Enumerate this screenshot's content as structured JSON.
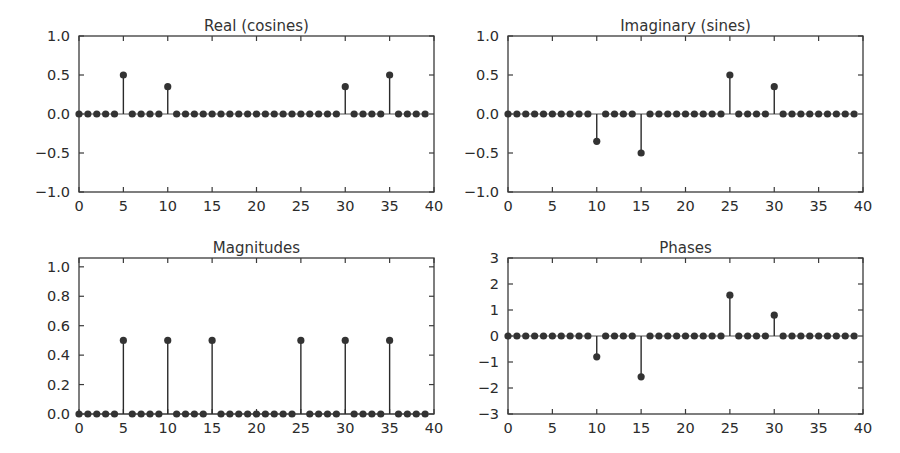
{
  "figure": {
    "background_color": "#ffffff",
    "marker_color": "#333333",
    "axis_color": "#3a3a3a",
    "width": 900,
    "height": 453
  },
  "chart_data": [
    {
      "type": "line",
      "plot_style": "stem",
      "title": "Real (cosines)",
      "xlabel": "",
      "ylabel": "",
      "xlim": [
        0,
        40
      ],
      "ylim": [
        -1.0,
        1.0
      ],
      "xticks": [
        0,
        5,
        10,
        15,
        20,
        25,
        30,
        35,
        40
      ],
      "xticklabels": [
        "0",
        "5",
        "10",
        "15",
        "20",
        "25",
        "30",
        "35",
        "40"
      ],
      "yticks": [
        -1.0,
        -0.5,
        0.0,
        0.5,
        1.0
      ],
      "yticklabels": [
        "-1.0",
        "-0.5",
        "0.0",
        "0.5",
        "1.0"
      ],
      "grid": false,
      "legend": null,
      "x": [
        0,
        1,
        2,
        3,
        4,
        5,
        6,
        7,
        8,
        9,
        10,
        11,
        12,
        13,
        14,
        15,
        16,
        17,
        18,
        19,
        20,
        21,
        22,
        23,
        24,
        25,
        26,
        27,
        28,
        29,
        30,
        31,
        32,
        33,
        34,
        35,
        36,
        37,
        38,
        39
      ],
      "values": [
        0,
        0,
        0,
        0,
        0,
        0.5,
        0,
        0,
        0,
        0,
        0.35,
        0,
        0,
        0,
        0,
        0,
        0,
        0,
        0,
        0,
        0,
        0,
        0,
        0,
        0,
        0,
        0,
        0,
        0,
        0,
        0.35,
        0,
        0,
        0,
        0,
        0.5,
        0,
        0,
        0,
        0
      ]
    },
    {
      "type": "line",
      "plot_style": "stem",
      "title": "Imaginary (sines)",
      "xlabel": "",
      "ylabel": "",
      "xlim": [
        0,
        40
      ],
      "ylim": [
        -1.0,
        1.0
      ],
      "xticks": [
        0,
        5,
        10,
        15,
        20,
        25,
        30,
        35,
        40
      ],
      "xticklabels": [
        "0",
        "5",
        "10",
        "15",
        "20",
        "25",
        "30",
        "35",
        "40"
      ],
      "yticks": [
        -1.0,
        -0.5,
        0.0,
        0.5,
        1.0
      ],
      "yticklabels": [
        "-1.0",
        "-0.5",
        "0.0",
        "0.5",
        "1.0"
      ],
      "grid": false,
      "legend": null,
      "x": [
        0,
        1,
        2,
        3,
        4,
        5,
        6,
        7,
        8,
        9,
        10,
        11,
        12,
        13,
        14,
        15,
        16,
        17,
        18,
        19,
        20,
        21,
        22,
        23,
        24,
        25,
        26,
        27,
        28,
        29,
        30,
        31,
        32,
        33,
        34,
        35,
        36,
        37,
        38,
        39
      ],
      "values": [
        0,
        0,
        0,
        0,
        0,
        0,
        0,
        0,
        0,
        0,
        -0.35,
        0,
        0,
        0,
        0,
        -0.5,
        0,
        0,
        0,
        0,
        0,
        0,
        0,
        0,
        0,
        0.5,
        0,
        0,
        0,
        0,
        0.35,
        0,
        0,
        0,
        0,
        0,
        0,
        0,
        0,
        0
      ]
    },
    {
      "type": "line",
      "plot_style": "stem",
      "title": "Magnitudes",
      "xlabel": "",
      "ylabel": "",
      "xlim": [
        0,
        40
      ],
      "ylim": [
        0.0,
        1.06
      ],
      "xticks": [
        0,
        5,
        10,
        15,
        20,
        25,
        30,
        35,
        40
      ],
      "xticklabels": [
        "0",
        "5",
        "10",
        "15",
        "20",
        "25",
        "30",
        "35",
        "40"
      ],
      "yticks": [
        0.0,
        0.2,
        0.4,
        0.6,
        0.8,
        1.0
      ],
      "yticklabels": [
        "0.0",
        "0.2",
        "0.4",
        "0.6",
        "0.8",
        "1.0"
      ],
      "grid": false,
      "legend": null,
      "x": [
        0,
        1,
        2,
        3,
        4,
        5,
        6,
        7,
        8,
        9,
        10,
        11,
        12,
        13,
        14,
        15,
        16,
        17,
        18,
        19,
        20,
        21,
        22,
        23,
        24,
        25,
        26,
        27,
        28,
        29,
        30,
        31,
        32,
        33,
        34,
        35,
        36,
        37,
        38,
        39
      ],
      "values": [
        0,
        0,
        0,
        0,
        0,
        0.5,
        0,
        0,
        0,
        0,
        0.5,
        0,
        0,
        0,
        0,
        0.5,
        0,
        0,
        0,
        0,
        0,
        0,
        0,
        0,
        0,
        0.5,
        0,
        0,
        0,
        0,
        0.5,
        0,
        0,
        0,
        0,
        0.5,
        0,
        0,
        0,
        0
      ]
    },
    {
      "type": "line",
      "plot_style": "stem",
      "title": "Phases",
      "xlabel": "",
      "ylabel": "",
      "xlim": [
        0,
        40
      ],
      "ylim": [
        -3,
        3
      ],
      "xticks": [
        0,
        5,
        10,
        15,
        20,
        25,
        30,
        35,
        40
      ],
      "xticklabels": [
        "0",
        "5",
        "10",
        "15",
        "20",
        "25",
        "30",
        "35",
        "40"
      ],
      "yticks": [
        -3,
        -2,
        -1,
        0,
        1,
        2,
        3
      ],
      "yticklabels": [
        "-3",
        "-2",
        "-1",
        "0",
        "1",
        "2",
        "3"
      ],
      "grid": false,
      "legend": null,
      "x": [
        0,
        1,
        2,
        3,
        4,
        5,
        6,
        7,
        8,
        9,
        10,
        11,
        12,
        13,
        14,
        15,
        16,
        17,
        18,
        19,
        20,
        21,
        22,
        23,
        24,
        25,
        26,
        27,
        28,
        29,
        30,
        31,
        32,
        33,
        34,
        35,
        36,
        37,
        38,
        39
      ],
      "values": [
        0,
        0,
        0,
        0,
        0,
        0,
        0,
        0,
        0,
        0,
        -0.8,
        0,
        0,
        0,
        0,
        -1.57,
        0,
        0,
        0,
        0,
        0,
        0,
        0,
        0,
        0,
        1.57,
        0,
        0,
        0,
        0,
        0.8,
        0,
        0,
        0,
        0,
        0,
        0,
        0,
        0,
        0
      ]
    }
  ],
  "panels": [
    {
      "name": "real-cosines",
      "left": 79,
      "top": 36,
      "width": 355,
      "height": 156,
      "title_top": 17
    },
    {
      "name": "imaginary-sines",
      "left": 508,
      "top": 36,
      "width": 355,
      "height": 156,
      "title_top": 17
    },
    {
      "name": "magnitudes",
      "left": 79,
      "top": 258,
      "width": 355,
      "height": 156,
      "title_top": 239
    },
    {
      "name": "phases",
      "left": 508,
      "top": 258,
      "width": 355,
      "height": 156,
      "title_top": 239
    }
  ]
}
